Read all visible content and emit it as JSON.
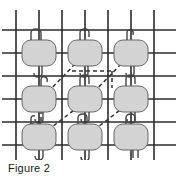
{
  "figure": {
    "caption": "Figure 2",
    "title": "Figure 2",
    "colors": {
      "background": "#ffffff",
      "grid_line": "#2b2b2b",
      "node_fill": "#d3d3d3",
      "node_stroke": "#555555",
      "dashed_line": "#333333",
      "hook_stroke": "#444444",
      "caption_text": "#1a1a1a"
    },
    "grid": {
      "vertical_lines_x": [
        16,
        39,
        62,
        85,
        108,
        131,
        154
      ],
      "horizontal_lines_y": [
        30,
        53,
        76,
        99,
        122,
        145
      ],
      "vertical_span_y": [
        10,
        160
      ],
      "horizontal_span_x": [
        2,
        176
      ],
      "line_width": 1.6,
      "cell_size": 23
    },
    "nodes": [
      {
        "id": "n1",
        "row": 0,
        "col": 0,
        "cx": 39,
        "cy": 53,
        "label": "node-r0-c0"
      },
      {
        "id": "n2",
        "row": 0,
        "col": 1,
        "cx": 85,
        "cy": 53,
        "label": "node-r0-c1"
      },
      {
        "id": "n3",
        "row": 0,
        "col": 2,
        "cx": 131,
        "cy": 53,
        "label": "node-r0-c2"
      },
      {
        "id": "n4",
        "row": 1,
        "col": 0,
        "cx": 39,
        "cy": 99,
        "label": "node-r1-c0"
      },
      {
        "id": "n5",
        "row": 1,
        "col": 1,
        "cx": 85,
        "cy": 99,
        "label": "node-r1-c1"
      },
      {
        "id": "n6",
        "row": 1,
        "col": 2,
        "cx": 131,
        "cy": 99,
        "label": "node-r1-c2"
      },
      {
        "id": "n7",
        "row": 2,
        "col": 0,
        "cx": 39,
        "cy": 137,
        "label": "node-r2-c0"
      },
      {
        "id": "n8",
        "row": 2,
        "col": 1,
        "cx": 85,
        "cy": 137,
        "label": "node-r2-c1"
      },
      {
        "id": "n9",
        "row": 2,
        "col": 2,
        "cx": 131,
        "cy": 137,
        "label": "node-r2-c2"
      }
    ],
    "node_shape": {
      "width": 34,
      "height": 26,
      "corner_radius": 9
    },
    "dashed_edges": [
      {
        "from": "n4",
        "to": "n2",
        "kind": "diagonal-up-right"
      },
      {
        "from": "n7",
        "to": "n5",
        "kind": "diagonal-up-right"
      },
      {
        "from": "n5",
        "to": "n3",
        "kind": "diagonal-up-right"
      },
      {
        "from": "n8",
        "to": "n6",
        "kind": "diagonal-up-right"
      },
      {
        "from": "n2",
        "to": "n3",
        "kind": "horizontal-offset"
      },
      {
        "from": "n3",
        "to": "n6",
        "kind": "vertical-offset"
      },
      {
        "from": "n4",
        "to": "n7",
        "kind": "vertical-offset"
      }
    ],
    "dash_pattern": "4 3",
    "hook_count_per_node": 2
  }
}
